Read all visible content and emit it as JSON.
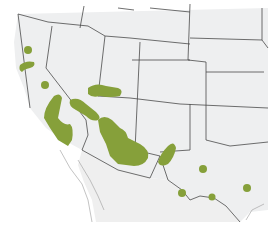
{
  "map": {
    "type": "species-range-map",
    "region": "Southwestern United States and northern Mexico",
    "labels": [],
    "colors": {
      "background": "#ffffff",
      "land": "#eeeff0",
      "borders": "#4a4a4a",
      "range": "#86a03a"
    },
    "range_areas": [
      {
        "name": "northern-california-dot",
        "shape": "dot"
      },
      {
        "name": "san-francisco-bay-patch",
        "shape": "patch"
      },
      {
        "name": "central-california-dot",
        "shape": "dot"
      },
      {
        "name": "southern-california-range",
        "shape": "patch"
      },
      {
        "name": "southern-nevada-utah-band",
        "shape": "patch"
      },
      {
        "name": "lower-colorado-river-patch",
        "shape": "patch"
      },
      {
        "name": "central-arizona-range",
        "shape": "patch"
      },
      {
        "name": "southwest-new-mexico-patch",
        "shape": "patch"
      },
      {
        "name": "west-texas-dot",
        "shape": "dot"
      },
      {
        "name": "big-bend-dot",
        "shape": "dot"
      },
      {
        "name": "rio-grande-dot",
        "shape": "dot"
      },
      {
        "name": "central-texas-dot",
        "shape": "dot"
      }
    ]
  }
}
